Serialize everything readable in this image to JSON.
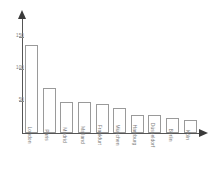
{
  "chart_data": {
    "type": "bar",
    "title": "",
    "subtitle": "",
    "xlabel": "",
    "ylabel": "",
    "categories": [
      "London",
      "Paris",
      "Madrid",
      "Mailand",
      "Frankfurt",
      "München",
      "Hamburg",
      "Düsseldorf",
      "Berlin",
      "Köln"
    ],
    "values": [
      137,
      70,
      49,
      49,
      45,
      39,
      28,
      28,
      24,
      20
    ],
    "yticks": [
      50,
      100,
      150
    ],
    "ytick_labels": [
      "50",
      "100",
      "150"
    ],
    "ylim": [
      0,
      180
    ],
    "grid": false,
    "legend": null,
    "legend_position": "none",
    "annotations": [],
    "axis_style": "arrow-headed",
    "bar_fill": "#ffffff",
    "bar_stroke": "#9a9a9a",
    "axis_color": "#555555",
    "tick_label_color": "#7d7d7d"
  }
}
